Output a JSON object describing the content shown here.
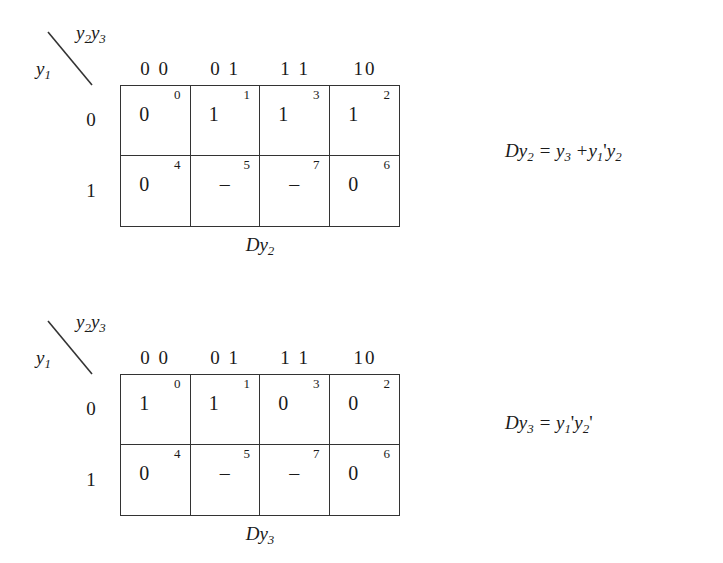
{
  "page": {
    "background": "#ffffff",
    "ink": "#1a1a1a",
    "line_color": "#333333"
  },
  "kmaps": [
    {
      "id": "kmap-dy2",
      "corner": {
        "top_label_html": "y2y3",
        "top_var": "y",
        "top_var_sub_a": "2",
        "top_var_b": "y",
        "top_var_sub_b": "3",
        "left_var": "y",
        "left_var_sub": "1"
      },
      "column_headers": [
        "0 0",
        "0 1",
        "1 1",
        "10"
      ],
      "row_labels": [
        "0",
        "1"
      ],
      "cells": [
        {
          "index": "0",
          "value": "0"
        },
        {
          "index": "1",
          "value": "1"
        },
        {
          "index": "3",
          "value": "1"
        },
        {
          "index": "2",
          "value": "1"
        },
        {
          "index": "4",
          "value": "0"
        },
        {
          "index": "5",
          "value": "–"
        },
        {
          "index": "7",
          "value": "–"
        },
        {
          "index": "6",
          "value": "0"
        }
      ],
      "caption": {
        "prefix": "D",
        "var": "y",
        "sub": "2"
      },
      "equation": {
        "lhs_prefix": "D",
        "lhs_var": "y",
        "lhs_sub": "2",
        "eq": "=",
        "t1_var": "y",
        "t1_sub": "3",
        "op": "+",
        "t2a_var": "y",
        "t2a_sub": "1",
        "t2a_prime": "'",
        "t2b_var": "y",
        "t2b_sub": "2",
        "t2b_prime": ""
      }
    },
    {
      "id": "kmap-dy3",
      "corner": {
        "top_label_html": "y2y3",
        "top_var": "y",
        "top_var_sub_a": "2",
        "top_var_b": "y",
        "top_var_sub_b": "3",
        "left_var": "y",
        "left_var_sub": "1"
      },
      "column_headers": [
        "0 0",
        "0 1",
        "1 1",
        "10"
      ],
      "row_labels": [
        "0",
        "1"
      ],
      "cells": [
        {
          "index": "0",
          "value": "1"
        },
        {
          "index": "1",
          "value": "1"
        },
        {
          "index": "3",
          "value": "0"
        },
        {
          "index": "2",
          "value": "0"
        },
        {
          "index": "4",
          "value": "0"
        },
        {
          "index": "5",
          "value": "–"
        },
        {
          "index": "7",
          "value": "–"
        },
        {
          "index": "6",
          "value": "0"
        }
      ],
      "caption": {
        "prefix": "D",
        "var": "y",
        "sub": "3"
      },
      "equation": {
        "lhs_prefix": "D",
        "lhs_var": "y",
        "lhs_sub": "3",
        "eq": "=",
        "t1_var": "",
        "t1_sub": "",
        "op": "",
        "t2a_var": "y",
        "t2a_sub": "1",
        "t2a_prime": "'",
        "t2b_var": "y",
        "t2b_sub": "2",
        "t2b_prime": "'"
      }
    }
  ]
}
